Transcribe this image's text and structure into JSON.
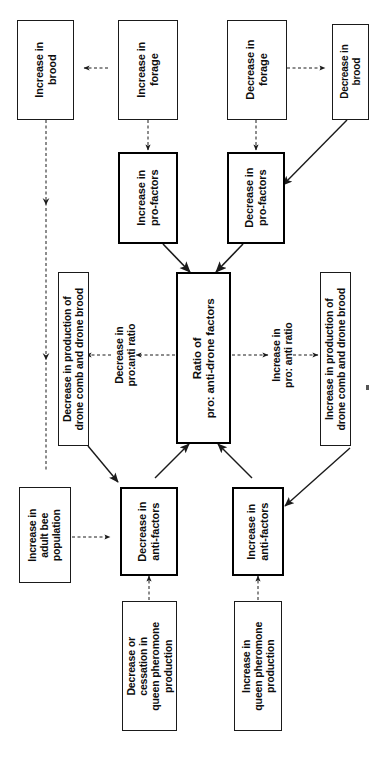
{
  "diagram": {
    "orientation": "rotated-90-ccw",
    "colors": {
      "line": "#1a1a1a",
      "box_border": "#1a1a1a",
      "bold_box_border": "#000000",
      "background": "#ffffff",
      "text": "#0d0d0d"
    },
    "nodes": [
      {
        "id": "increase-brood",
        "label": "Increase in\nbrood",
        "emphasis": "normal"
      },
      {
        "id": "increase-forage",
        "label": "Increase in\nforage",
        "emphasis": "normal"
      },
      {
        "id": "decrease-forage",
        "label": "Decrease in\nforage",
        "emphasis": "normal"
      },
      {
        "id": "decrease-brood",
        "label": "Decrease in\nbrood",
        "emphasis": "normal"
      },
      {
        "id": "increase-pro-factors",
        "label": "Increase in\npro-factors",
        "emphasis": "bold"
      },
      {
        "id": "decrease-pro-factors",
        "label": "Decrease in\npro-factors",
        "emphasis": "bold"
      },
      {
        "id": "ratio",
        "label": "Ratio of\npro: anti-drone factors",
        "emphasis": "bold"
      },
      {
        "id": "decrease-production",
        "label": "Decrease in production of\ndrone comb and drone brood",
        "emphasis": "normal"
      },
      {
        "id": "increase-production",
        "label": "Increase in production of\ndrone comb and drone brood",
        "emphasis": "normal"
      },
      {
        "id": "increase-adult-bees",
        "label": "Increase in\nadult bee\npopulation",
        "emphasis": "normal"
      },
      {
        "id": "decrease-anti-factors",
        "label": "Decrease in\nanti-factors",
        "emphasis": "bold"
      },
      {
        "id": "increase-anti-factors",
        "label": "Increase in\nanti-factors",
        "emphasis": "bold"
      },
      {
        "id": "decrease-queen-pheromone",
        "label": "Decrease or\ncessation in\nqueen pheromone\nproduction",
        "emphasis": "normal"
      },
      {
        "id": "increase-queen-pheromone",
        "label": "Increase in\nqueen pheromone\nproduction",
        "emphasis": "normal"
      }
    ],
    "edge_labels": [
      {
        "id": "decrease-ratio-label",
        "label": "Decrease in\npro:anti ratio"
      },
      {
        "id": "increase-ratio-label",
        "label": "Increase in\npro: anti ratio"
      }
    ],
    "edges": [
      {
        "from": "increase-forage",
        "to": "increase-brood",
        "style": "dashed"
      },
      {
        "from": "increase-forage",
        "to": "increase-pro-factors",
        "style": "dashed"
      },
      {
        "from": "increase-brood",
        "to": "increase-adult-bees",
        "style": "dashed"
      },
      {
        "from": "decrease-forage",
        "to": "decrease-brood",
        "style": "dashed"
      },
      {
        "from": "decrease-forage",
        "to": "decrease-pro-factors",
        "style": "dashed"
      },
      {
        "from": "decrease-brood",
        "to": "decrease-pro-factors",
        "style": "solid"
      },
      {
        "from": "decrease-brood",
        "to": "increase-anti-factors",
        "style": "solid"
      },
      {
        "from": "increase-pro-factors",
        "to": "ratio",
        "style": "solid"
      },
      {
        "from": "decrease-pro-factors",
        "to": "ratio",
        "style": "solid"
      },
      {
        "from": "decrease-anti-factors",
        "to": "ratio",
        "style": "solid"
      },
      {
        "from": "increase-anti-factors",
        "to": "ratio",
        "style": "solid"
      },
      {
        "from": "ratio",
        "to": "decrease-production",
        "style": "dashed"
      },
      {
        "from": "ratio",
        "to": "increase-production",
        "style": "dashed"
      },
      {
        "from": "decrease-production",
        "to": "decrease-anti-factors",
        "style": "solid"
      },
      {
        "from": "increase-adult-bees",
        "to": "decrease-anti-factors",
        "style": "dashed"
      },
      {
        "from": "decrease-queen-pheromone",
        "to": "decrease-anti-factors",
        "style": "dashed"
      },
      {
        "from": "increase-queen-pheromone",
        "to": "increase-anti-factors",
        "style": "dashed"
      }
    ]
  }
}
